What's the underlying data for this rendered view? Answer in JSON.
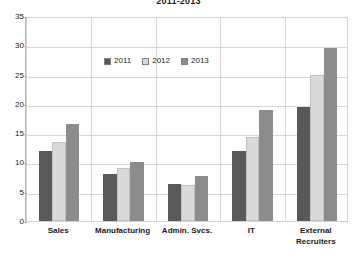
{
  "chart_data": {
    "type": "bar",
    "title": "2011-2013",
    "xlabel": "",
    "ylabel": "",
    "ylim": [
      0,
      35
    ],
    "ytick_step": 5,
    "yticks": [
      "0",
      "5",
      "10",
      "15",
      "20",
      "25",
      "30",
      "35"
    ],
    "grid": true,
    "legend_position": "top-center",
    "categories": [
      "Sales",
      "Manufacturing",
      "Admin. Svcs.",
      "IT",
      "External Recruiters"
    ],
    "category_lines": [
      [
        "Sales"
      ],
      [
        "Manufacturing"
      ],
      [
        "Admin. Svcs."
      ],
      [
        "IT"
      ],
      [
        "External",
        "Recruiters"
      ]
    ],
    "series": [
      {
        "name": "2011",
        "color": "#595959",
        "values": [
          12.0,
          8.0,
          6.3,
          12.0,
          19.5
        ]
      },
      {
        "name": "2012",
        "color": "#d9d9d9",
        "values": [
          13.5,
          9.0,
          6.2,
          14.3,
          25.0
        ]
      },
      {
        "name": "2013",
        "color": "#8c8c8c",
        "values": [
          16.5,
          10.0,
          7.7,
          19.0,
          29.5
        ]
      }
    ]
  },
  "colors": {
    "plot_background": "#ffffff",
    "gridline": "#d8d8d8",
    "axis": "#b9b9b9",
    "border": "#d2d2d2",
    "text": "#1a1a1a"
  }
}
